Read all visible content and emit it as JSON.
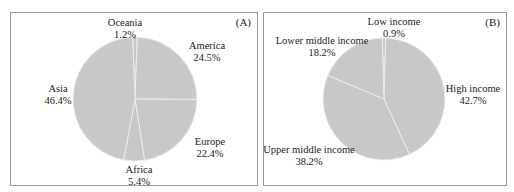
{
  "chart_data": [
    {
      "type": "pie",
      "panel_label": "(A)",
      "title": "",
      "categories": [
        "Oceania",
        "America",
        "Europe",
        "Africa",
        "Asia"
      ],
      "values": [
        1.2,
        24.5,
        22.4,
        5.4,
        46.4
      ],
      "value_labels": [
        "1.2%",
        "24.5%",
        "22.4%",
        "5.4%",
        "46.4%"
      ],
      "unit": "%",
      "fill_color": "#c8c8c8",
      "separator_color": "#ececec",
      "legend": "none (direct labels)"
    },
    {
      "type": "pie",
      "panel_label": "(B)",
      "title": "",
      "categories": [
        "Low income",
        "High income",
        "Upper middle income",
        "Lower middle income"
      ],
      "values": [
        0.9,
        42.7,
        38.2,
        18.2
      ],
      "value_labels": [
        "0.9%",
        "42.7%",
        "38.2%",
        "18.2%"
      ],
      "unit": "%",
      "fill_color": "#c8c8c8",
      "separator_color": "#ececec",
      "legend": "none (direct labels)"
    }
  ],
  "panels": {
    "a": {
      "tag": "(A)",
      "labels": {
        "oceania": {
          "name": "Oceania",
          "pct": "1.2%"
        },
        "america": {
          "name": "America",
          "pct": "24.5%"
        },
        "europe": {
          "name": "Europe",
          "pct": "22.4%"
        },
        "africa": {
          "name": "Africa",
          "pct": "5.4%"
        },
        "asia": {
          "name": "Asia",
          "pct": "46.4%"
        }
      }
    },
    "b": {
      "tag": "(B)",
      "labels": {
        "low": {
          "name": "Low income",
          "pct": "0.9%"
        },
        "high": {
          "name": "High income",
          "pct": "42.7%"
        },
        "upper": {
          "name": "Upper middle income",
          "pct": "38.2%"
        },
        "lower": {
          "name": "Lower middle income",
          "pct": "18.2%"
        }
      }
    }
  }
}
